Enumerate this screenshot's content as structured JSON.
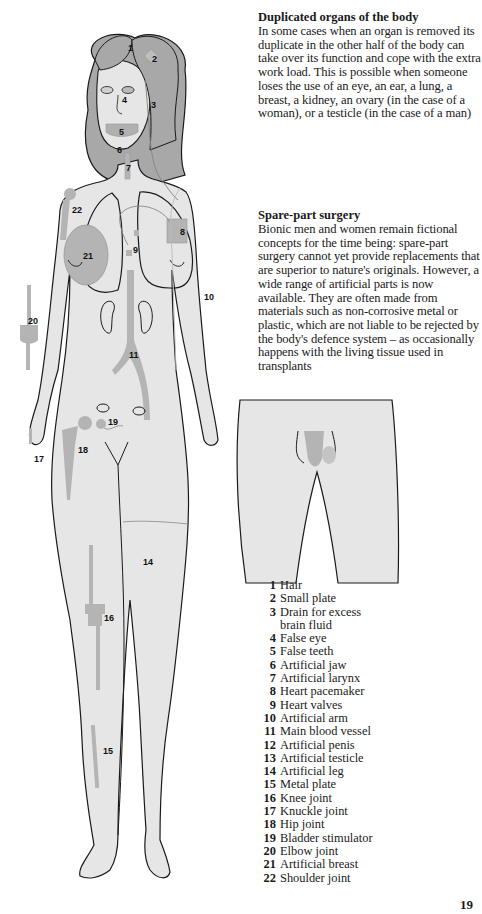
{
  "sections": {
    "duplicated": {
      "heading": "Duplicated organs of the body",
      "body": "In some cases when an organ is removed its duplicate in the other half of the body can take over its function and cope with the extra work load. This is possible when someone loses the use of an eye, an ear, a lung, a breast, a kidney, an ovary (in the case of a woman), or a testicle (in the case of a man)"
    },
    "spare_part": {
      "heading": "Spare-part surgery",
      "body": "Bionic men and women remain fictional concepts for the time being: spare-part surgery cannot yet provide replacements that are superior to nature's originals. However, a wide range of artificial parts is now available. They are often made from materials such as non-corrosive metal or plastic, which are not liable to be rejected by the body's defence system – as occasionally happens with the living tissue used in transplants"
    }
  },
  "legend": [
    {
      "n": "1",
      "label": "Hair"
    },
    {
      "n": "2",
      "label": "Small plate"
    },
    {
      "n": "3",
      "label": "Drain for excess",
      "cont": "brain fluid"
    },
    {
      "n": "4",
      "label": "False eye"
    },
    {
      "n": "5",
      "label": "False teeth"
    },
    {
      "n": "6",
      "label": "Artificial jaw"
    },
    {
      "n": "7",
      "label": "Artificial larynx"
    },
    {
      "n": "8",
      "label": "Heart pacemaker"
    },
    {
      "n": "9",
      "label": "Heart valves"
    },
    {
      "n": "10",
      "label": "Artificial arm"
    },
    {
      "n": "11",
      "label": "Main blood vessel"
    },
    {
      "n": "12",
      "label": "Artificial penis"
    },
    {
      "n": "13",
      "label": "Artificial testicle"
    },
    {
      "n": "14",
      "label": "Artificial leg"
    },
    {
      "n": "15",
      "label": "Metal plate"
    },
    {
      "n": "16",
      "label": "Knee joint"
    },
    {
      "n": "17",
      "label": "Knuckle joint"
    },
    {
      "n": "18",
      "label": "Hip joint"
    },
    {
      "n": "19",
      "label": "Bladder stimulator"
    },
    {
      "n": "20",
      "label": "Elbow joint"
    },
    {
      "n": "21",
      "label": "Artificial breast"
    },
    {
      "n": "22",
      "label": "Shoulder joint"
    }
  ],
  "figure_labels": {
    "l1": "1",
    "l2": "2",
    "l3": "3",
    "l4": "4",
    "l5": "5",
    "l6": "6",
    "l7": "7",
    "l8": "8",
    "l9": "9",
    "l10": "10",
    "l11": "11",
    "l12": "12",
    "l13": "13",
    "l14": "14",
    "l15": "15",
    "l16": "16",
    "l17": "17",
    "l18": "18",
    "l19": "19",
    "l20": "20",
    "l21": "21",
    "l22": "22"
  },
  "page_number": "19",
  "colors": {
    "skin": "#e6e6e6",
    "implant": "#b4b4b4",
    "hair": "#a8a8a8",
    "outline": "#1a1a1a"
  }
}
